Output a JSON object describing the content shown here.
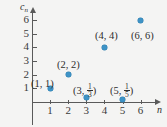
{
  "chart_data": {
    "type": "scatter",
    "title": "",
    "subtitle": "",
    "xlabel": "n",
    "ylabel": "c",
    "ylabel_subscript": "n",
    "grid": false,
    "legend": "none",
    "xlim": [
      0,
      6.8
    ],
    "ylim": [
      0,
      6.6
    ],
    "x_ticks": [
      "1",
      "2",
      "3",
      "4",
      "5",
      "6"
    ],
    "y_ticks": [
      "1",
      "2",
      "3",
      "4",
      "5",
      "6"
    ],
    "x_tick_values": [
      1,
      2,
      3,
      4,
      5,
      6
    ],
    "y_tick_values": [
      1,
      2,
      3,
      4,
      5,
      6
    ],
    "x": [
      1,
      2,
      3,
      4,
      5,
      6
    ],
    "y": [
      1,
      2,
      0.3333333333,
      4,
      0.2,
      6
    ],
    "point_color": "#3e93c6",
    "axis_color": "#5a5a5a",
    "background_color": "#f4f4f3",
    "points": [
      {
        "n": 1,
        "value": 1,
        "label_prefix": "(1, ",
        "label_suffix": ")",
        "label_is_fraction": false,
        "label_value": "1",
        "label_numerator": "",
        "label_denominator": "",
        "label_left": 31,
        "label_top": 78
      },
      {
        "n": 2,
        "value": 2,
        "label_prefix": "(2, ",
        "label_suffix": ")",
        "label_is_fraction": false,
        "label_value": "2",
        "label_numerator": "",
        "label_denominator": "",
        "label_left": 57,
        "label_top": 59
      },
      {
        "n": 3,
        "value": 0.3333333333,
        "label_prefix": "(3, ",
        "label_suffix": ")",
        "label_is_fraction": true,
        "label_value": "1/3",
        "label_numerator": "1",
        "label_denominator": "3",
        "label_left": 73,
        "label_top": 83
      },
      {
        "n": 4,
        "value": 4,
        "label_prefix": "(4, ",
        "label_suffix": ")",
        "label_is_fraction": false,
        "label_value": "4",
        "label_numerator": "",
        "label_denominator": "",
        "label_left": 95,
        "label_top": 30
      },
      {
        "n": 5,
        "value": 0.2,
        "label_prefix": "(5, ",
        "label_suffix": ")",
        "label_is_fraction": true,
        "label_value": "1/5",
        "label_numerator": "1",
        "label_denominator": "5",
        "label_left": 110,
        "label_top": 83
      },
      {
        "n": 6,
        "value": 6,
        "label_prefix": "(6, ",
        "label_suffix": ")",
        "label_is_fraction": false,
        "label_value": "6",
        "label_numerator": "",
        "label_denominator": "",
        "label_left": 131,
        "label_top": 30
      }
    ]
  }
}
